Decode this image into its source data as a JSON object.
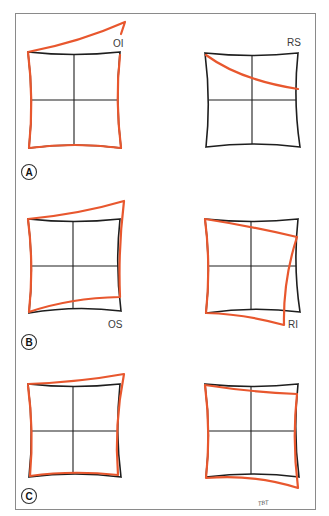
{
  "figure": {
    "panels": [
      {
        "id": "A",
        "label": "A",
        "left": {
          "tag": "OI"
        },
        "right": {
          "tag": "RS"
        }
      },
      {
        "id": "B",
        "label": "B",
        "left": {
          "tag": "OS"
        },
        "right": {
          "tag": "RI"
        }
      },
      {
        "id": "C",
        "label": "C",
        "left": {
          "tag": ""
        },
        "right": {
          "tag": ""
        }
      }
    ],
    "signature": "TBT",
    "colors": {
      "grid": "#1e1e1e",
      "deviation": "#e8572e",
      "frame": "#8a8a8a"
    }
  }
}
